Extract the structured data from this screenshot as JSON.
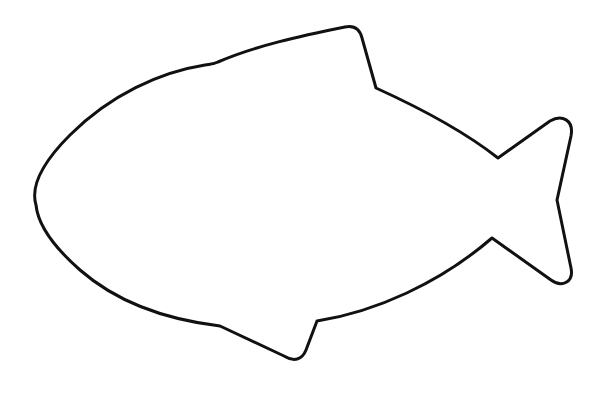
{
  "image": {
    "subject": "fish outline",
    "background_color": "#ffffff",
    "stroke_color": "#111111",
    "stroke_width": 3
  }
}
